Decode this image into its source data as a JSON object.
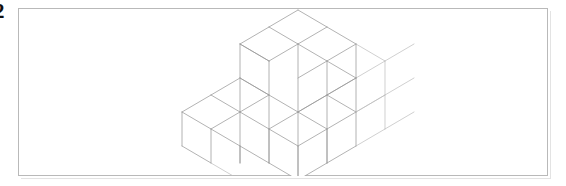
{
  "figure": {
    "label": "2",
    "caption": "",
    "frame": {
      "border_color": "#b9b9b9",
      "background_color": "#ffffff",
      "x": 18,
      "y": 8,
      "width": 530,
      "height": 168
    },
    "drawing": {
      "type": "isometric-line-drawing",
      "subject": "stack of unit cubes",
      "line_color": "#9a9a9a",
      "faint_line_color": "#bcbcbc",
      "fill_color": "#ffffff",
      "projection": "isometric",
      "cube_edge_px": 34,
      "iso_dx": 29.4,
      "iso_dy": 17.0,
      "origin_x": 269,
      "origin_y": 152,
      "grid": {
        "width": 4,
        "depth": 3,
        "height": 3
      },
      "total_visible_cubes": 18,
      "height_map_note": "heights per (column,row) of the 4x3 base grid, front-left to back-right",
      "height_map": [
        [
          1,
          1,
          3
        ],
        [
          1,
          1,
          3
        ],
        [
          1,
          2,
          3
        ],
        [
          2,
          2,
          2
        ]
      ],
      "description": "A staircase-like arrangement of unit cubes: a one-cube-high front platform rising to a three-cube-high back-left tower and a two-cube-high right wall."
    }
  }
}
